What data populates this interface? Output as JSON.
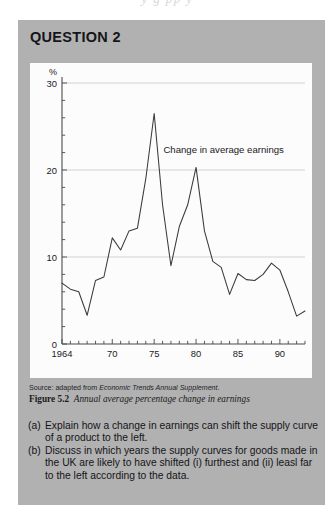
{
  "bleed_text": "y       g        pp y",
  "panel": {
    "title": "QUESTION 2",
    "background_color": "#b1b1b1"
  },
  "figure": {
    "source_prefix": "Source: adapted from ",
    "source_title": "Economic Trends Annual Supplement",
    "source_suffix": ".",
    "caption_label": "Figure 5.2",
    "caption_title": "Annual average percentage change in earnings"
  },
  "questions": [
    {
      "marker": "(a)",
      "text": "Explain how a change in earnings can shift the supply curve of a product to the left."
    },
    {
      "marker": "(b)",
      "text": "Discuss in which years the supply curves for goods made in the UK are likely to have shifted (i) furthest and (ii) leasl far to the left according to the data."
    }
  ],
  "chart_data": {
    "type": "line",
    "title": "",
    "annotation": "Change in average earnings",
    "xlabel": "",
    "ylabel": "%",
    "ylim": [
      0,
      30
    ],
    "xlim": [
      1964,
      1993
    ],
    "yticks": [
      0,
      10,
      20,
      30
    ],
    "ytick_labels": [
      "0",
      "10",
      "20",
      "30"
    ],
    "yminor_step": 2,
    "xticks": [
      1964,
      1970,
      1975,
      1980,
      1985,
      1990
    ],
    "xtick_labels": [
      "1964",
      "70",
      "75",
      "80",
      "85",
      "90"
    ],
    "grid": "horizontal",
    "grid_color": "#c8c8c8",
    "line_color": "#3a3a3a",
    "x": [
      1964,
      1965,
      1966,
      1967,
      1968,
      1969,
      1970,
      1971,
      1972,
      1973,
      1974,
      1975,
      1976,
      1977,
      1978,
      1979,
      1980,
      1981,
      1982,
      1983,
      1984,
      1985,
      1986,
      1987,
      1988,
      1989,
      1990,
      1991,
      1992,
      1993
    ],
    "values": [
      7.0,
      6.3,
      6.0,
      3.3,
      7.3,
      7.7,
      12.2,
      10.8,
      13.0,
      13.3,
      19.0,
      26.5,
      16.0,
      9.0,
      13.5,
      16.0,
      20.3,
      13.0,
      9.5,
      8.8,
      5.7,
      8.1,
      7.4,
      7.3,
      8.0,
      9.3,
      8.5,
      6.0,
      3.2,
      3.8
    ],
    "series_name": "Change in average earnings"
  }
}
